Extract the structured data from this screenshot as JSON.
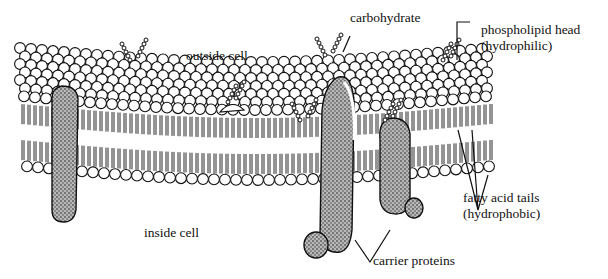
{
  "diagram": {
    "title": "",
    "type": "cell membrane (fluid mosaic model)",
    "labels": {
      "carbohydrate": "carbohydrate",
      "phospholipid_head_line1": "phospholipid head",
      "phospholipid_head_line2": "(hydrophilic)",
      "outside_cell": "outside cell",
      "inside_cell": "inside cell",
      "fatty_acid_line1": "fatty acid tails",
      "fatty_acid_line2": "(hydrophobic)",
      "carrier_proteins": "carrier proteins"
    },
    "colors": {
      "ink": "#111111",
      "background": "#ffffff",
      "protein_fill": "#9a9a9a"
    }
  }
}
